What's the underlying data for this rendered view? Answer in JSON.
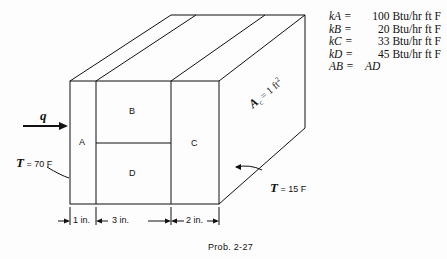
{
  "figure": {
    "caption": "Prob. 2-27",
    "heat_flow_label": "q",
    "regions": {
      "A": "A",
      "B": "B",
      "C": "C",
      "D": "D"
    },
    "area_label": "A",
    "area_subscript": "c",
    "area_value": "= 1 ft",
    "area_exponent": "2",
    "left_temperature": {
      "symbol": "T",
      "value": "= 70 F"
    },
    "right_temperature": {
      "symbol": "T",
      "value": "= 15 F"
    },
    "dimensions": [
      "1 in.",
      "3 in.",
      "2 in."
    ]
  },
  "properties": [
    {
      "symbol": "kA =",
      "value": "100 Btu/hr ft F"
    },
    {
      "symbol": "kB =",
      "value": "20 Btu/hr ft F"
    },
    {
      "symbol": "kC =",
      "value": "33 Btu/hr ft F"
    },
    {
      "symbol": "kD =",
      "value": "45 Btu/hr ft F"
    },
    {
      "symbol": "AB =",
      "value": "AD"
    }
  ]
}
